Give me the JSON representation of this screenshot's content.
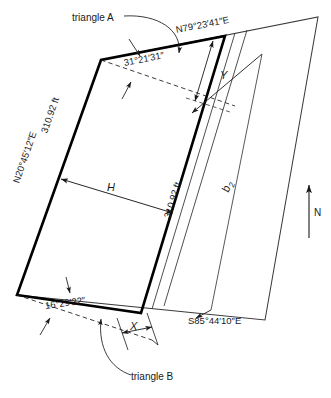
{
  "figure": {
    "type": "surveying-traverse-diagram",
    "notes": {
      "triangle_a": "triangle A",
      "triangle_b": "triangle B"
    },
    "bearings": {
      "top": "N79°23′41″E",
      "left": "N20°45′12″E",
      "bottom_right": "S85°44′10″E"
    },
    "angles": {
      "top_interior": "31°21′31″",
      "bottom_interior": "16°29′22″"
    },
    "distances": {
      "left_side": "310.92 ft",
      "right_side": "310.92 ft"
    },
    "variables": {
      "h": "H",
      "x": "X",
      "y": "Y",
      "b2_base": "b",
      "b2_sub": "2"
    },
    "compass": {
      "north_label": "N"
    }
  },
  "colors": {
    "ink": "#1a1a1a",
    "line_bold": "#000000",
    "line_thin": "#3a3a3a",
    "background": "#ffffff"
  }
}
